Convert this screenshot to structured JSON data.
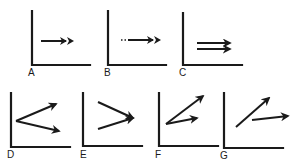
{
  "figure": {
    "panels": [
      {
        "label": "A",
        "arrows": "single horizontal arrow with double arrowhead"
      },
      {
        "label": "B",
        "arrows": "horizontal arrow with dotted tail and double arrowhead"
      },
      {
        "label": "C",
        "arrows": "two parallel horizontal arrows"
      },
      {
        "label": "D",
        "arrows": "two arrows diverging from a common origin (up-right and down-right)"
      },
      {
        "label": "E",
        "arrows": "two arrows converging to a common point"
      },
      {
        "label": "F",
        "arrows": "two arrows from a common origin, one steep and one shallow"
      },
      {
        "label": "G",
        "arrows": "two separate arrows, one steep and one nearly horizontal"
      }
    ]
  },
  "colors": {
    "ink": "#1a1a1a",
    "background": "#ffffff"
  }
}
